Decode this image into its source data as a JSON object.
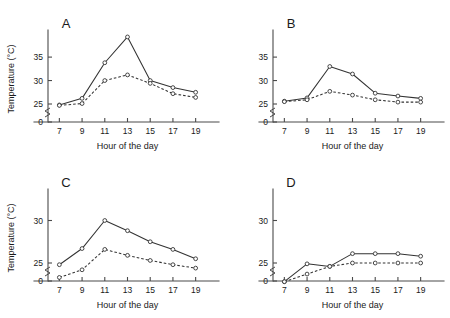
{
  "figure": {
    "axis_titles": {
      "x": "Hour of the day",
      "y": "Temperature (°C)"
    },
    "hours": [
      "7",
      "9",
      "11",
      "13",
      "15",
      "17",
      "19"
    ],
    "panel_labels": {
      "a": "A",
      "b": "B",
      "c": "C",
      "d": "D"
    },
    "colors": {
      "ink": "#1a1a1a",
      "axis": "#4a4a4a",
      "line": "#333333",
      "marker_fill": "#ffffff"
    }
  },
  "chart_data": [
    {
      "id": "A",
      "type": "line",
      "title": "A",
      "xlabel": "Hour of the day",
      "ylabel": "Temperature (°C)",
      "x": [
        7,
        9,
        11,
        13,
        15,
        17,
        19
      ],
      "xtick_labels": [
        "7",
        "9",
        "11",
        "13",
        "15",
        "17",
        "19"
      ],
      "ytick_labels": [
        "0",
        "25",
        "30",
        "35"
      ],
      "yticks": [
        0,
        25,
        30,
        35
      ],
      "ylim": [
        0,
        39.5
      ],
      "axis_break": true,
      "grid": false,
      "legend": "none",
      "series": [
        {
          "name": "solid",
          "style": "solid",
          "marker": "open-circle",
          "values": [
            24.8,
            26.2,
            33.8,
            39.3,
            30.0,
            28.5,
            27.5
          ]
        },
        {
          "name": "dashed",
          "style": "dashed",
          "marker": "open-circle",
          "values": [
            24.7,
            25.1,
            30.0,
            31.2,
            29.4,
            27.2,
            26.4
          ]
        }
      ]
    },
    {
      "id": "B",
      "type": "line",
      "title": "B",
      "xlabel": "Hour of the day",
      "ylabel": "Temperature (°C)",
      "x": [
        7,
        9,
        11,
        13,
        15,
        17,
        19
      ],
      "xtick_labels": [
        "7",
        "9",
        "11",
        "13",
        "15",
        "17",
        "19"
      ],
      "ytick_labels": [
        "0",
        "25",
        "30",
        "35"
      ],
      "yticks": [
        0,
        25,
        30,
        35
      ],
      "ylim": [
        0,
        39.5
      ],
      "axis_break": true,
      "grid": false,
      "legend": "none",
      "series": [
        {
          "name": "solid",
          "style": "solid",
          "marker": "open-circle",
          "values": [
            25.6,
            26.3,
            33.0,
            31.4,
            27.3,
            26.7,
            26.2
          ]
        },
        {
          "name": "dashed",
          "style": "dashed",
          "marker": "open-circle",
          "values": [
            25.5,
            25.9,
            27.7,
            26.9,
            25.9,
            25.4,
            25.4
          ]
        }
      ]
    },
    {
      "id": "C",
      "type": "line",
      "title": "C",
      "xlabel": "Hour of the day",
      "ylabel": "Temperature (°C)",
      "x": [
        7,
        9,
        11,
        13,
        15,
        17,
        19
      ],
      "xtick_labels": [
        "7",
        "9",
        "11",
        "13",
        "15",
        "17",
        "19"
      ],
      "ytick_labels": [
        "0",
        "25",
        "30"
      ],
      "yticks": [
        0,
        25,
        30
      ],
      "ylim": [
        0,
        33
      ],
      "axis_break": true,
      "grid": false,
      "legend": "none",
      "series": [
        {
          "name": "solid",
          "style": "solid",
          "marker": "open-circle",
          "values": [
            24.8,
            26.7,
            30.0,
            28.8,
            27.5,
            26.6,
            25.5
          ]
        },
        {
          "name": "dashed",
          "style": "dashed",
          "marker": "open-circle",
          "values": [
            23.3,
            24.2,
            26.6,
            25.9,
            25.3,
            24.8,
            24.4
          ]
        }
      ]
    },
    {
      "id": "D",
      "type": "line",
      "title": "D",
      "xlabel": "Hour of the day",
      "ylabel": "Temperature (°C)",
      "x": [
        7,
        9,
        11,
        13,
        15,
        17,
        19
      ],
      "xtick_labels": [
        "7",
        "9",
        "11",
        "13",
        "15",
        "17",
        "19"
      ],
      "ytick_labels": [
        "0",
        "25",
        "30"
      ],
      "yticks": [
        0,
        25,
        30
      ],
      "ylim": [
        0,
        33
      ],
      "axis_break": true,
      "grid": false,
      "legend": "none",
      "series": [
        {
          "name": "solid",
          "style": "solid",
          "marker": "open-circle",
          "values": [
            22.8,
            24.9,
            24.6,
            26.1,
            26.1,
            26.1,
            25.8
          ]
        },
        {
          "name": "dashed",
          "style": "dashed",
          "marker": "open-circle",
          "values": [
            22.8,
            23.7,
            24.6,
            25.0,
            25.0,
            25.0,
            25.0
          ]
        }
      ]
    }
  ]
}
